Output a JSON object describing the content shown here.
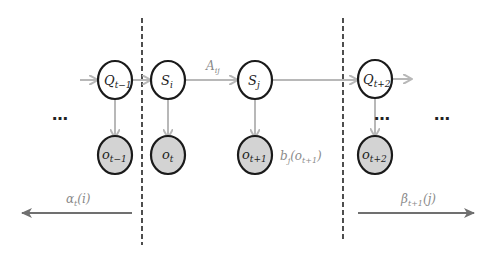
{
  "diagram": {
    "type": "hidden-markov-model-forward-backward",
    "colors": {
      "node_stroke": "#1a1a1a",
      "hidden_fill": "#ffffff",
      "observed_fill": "#d3d3d3",
      "edge": "#b8b8b8",
      "flow_arrow": "#707070",
      "label_gray": "#8a8a8a"
    },
    "hidden_nodes": [
      {
        "id": "Q_t-1",
        "base": "Q",
        "sub": "t−1"
      },
      {
        "id": "S_i",
        "base": "S",
        "sub": "i"
      },
      {
        "id": "S_j",
        "base": "S",
        "sub": "j"
      },
      {
        "id": "Q_t+2",
        "base": "Q",
        "sub": "t+2"
      }
    ],
    "observed_nodes": [
      {
        "id": "o_t-1",
        "base": "o",
        "sub": "t−1"
      },
      {
        "id": "o_t",
        "base": "o",
        "sub": "t"
      },
      {
        "id": "o_t+1",
        "base": "o",
        "sub": "t+1"
      },
      {
        "id": "o_t+2",
        "base": "o",
        "sub": "t+2"
      }
    ],
    "edges": [
      {
        "from": "start",
        "to": "Q_t-1"
      },
      {
        "from": "Q_t-1",
        "to": "S_i"
      },
      {
        "from": "S_i",
        "to": "S_j",
        "label_base": "A",
        "label_sub": "ij"
      },
      {
        "from": "S_j",
        "to": "Q_t+2"
      },
      {
        "from": "Q_t+2",
        "to": "end"
      },
      {
        "from": "Q_t-1",
        "to": "o_t-1"
      },
      {
        "from": "S_i",
        "to": "o_t"
      },
      {
        "from": "S_j",
        "to": "o_t+1"
      },
      {
        "from": "Q_t+2",
        "to": "o_t+2"
      }
    ],
    "emission_label": {
      "base": "b",
      "sub": "j",
      "arg_base": "o",
      "arg_sub": "t+1"
    },
    "ellipsis": "…",
    "alpha_label": {
      "base": "α",
      "sub": "t",
      "arg": "(i)"
    },
    "beta_label": {
      "base": "β",
      "sub": "t+1",
      "arg": "(j)"
    }
  }
}
